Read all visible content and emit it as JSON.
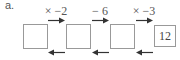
{
  "label": "a.",
  "operations": [
    "× −2",
    "− 6",
    "× −3"
  ],
  "boxes": [
    "",
    "",
    "",
    "12"
  ],
  "colors": {
    "line": "#999999",
    "text": "#555555",
    "arrow": "#333333"
  }
}
